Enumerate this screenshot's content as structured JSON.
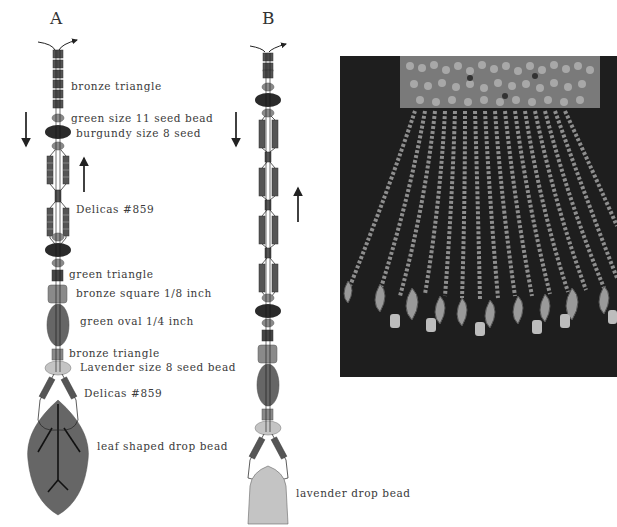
{
  "diagram_a": {
    "heading": "A",
    "labels": [
      "bronze triangle",
      "green size 11 seed bead",
      "burgundy size 8 seed",
      "Delicas #859",
      "green triangle",
      "bronze square 1/8 inch",
      "green oval 1/4 inch",
      "bronze triangle",
      "Lavender size 8 seed bead",
      "Delicas #859",
      "leaf shaped drop bead"
    ]
  },
  "diagram_b": {
    "heading": "B",
    "labels": [
      "lavender drop bead"
    ]
  },
  "photo": {
    "subject": "beaded fringe with leaf-shaped drop beads on dark fabric"
  },
  "colors": {
    "delica": "#5a5a5a",
    "burgundy": "#2b2b2b",
    "green_seed": "#8a8a8a",
    "bronze": "#7a7a7a",
    "green_oval": "#6a6a6a",
    "lavender": "#c4c4c4",
    "leaf": "#666666"
  }
}
